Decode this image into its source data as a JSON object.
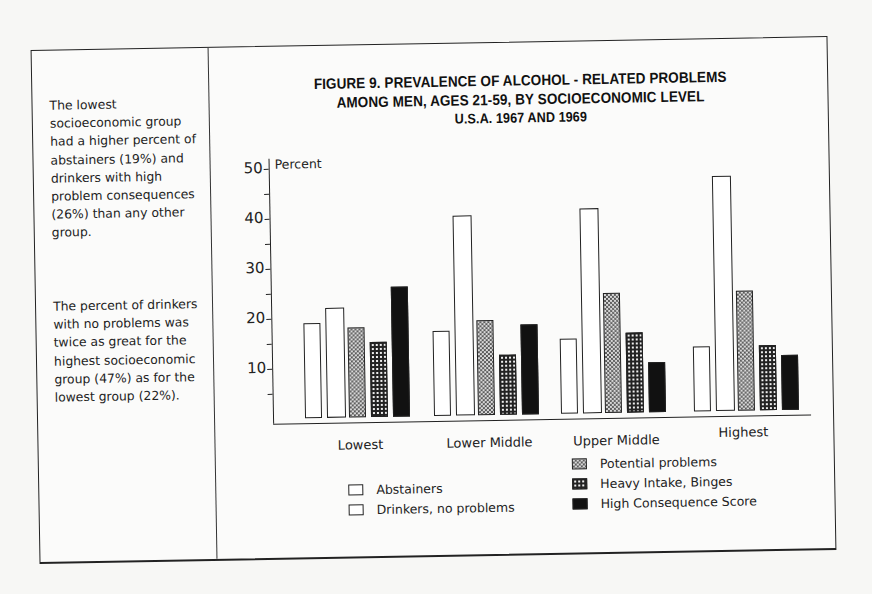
{
  "sidebar_notes": {
    "note1": "The lowest socioeconomic group had a higher percent of abstainers (19%) and drinkers with high problem consequences (26%) than any other group.",
    "note2": "The percent of drinkers with no problems was twice as great for the highest socioeconomic group (47%) as for the lowest group (22%)."
  },
  "chart_data": {
    "type": "bar",
    "title": "FIGURE 9. PREVALENCE OF ALCOHOL - RELATED PROBLEMS AMONG MEN, AGES 21-59, BY SOCIOECONOMIC LEVEL U.S.A. 1967 AND 1969",
    "title_lines": [
      "FIGURE 9.  PREVALENCE OF ALCOHOL - RELATED PROBLEMS",
      "AMONG MEN, AGES 21-59, BY SOCIOECONOMIC LEVEL",
      "U.S.A. 1967 AND 1969"
    ],
    "xlabel": "",
    "ylabel": "Percent",
    "ylim": [
      0,
      50
    ],
    "yticks": [
      10,
      20,
      30,
      40,
      50
    ],
    "grid": false,
    "legend_position": "bottom",
    "categories": [
      "Lowest",
      "Lower Middle",
      "Upper Middle",
      "Highest"
    ],
    "series": [
      {
        "name": "Abstainers",
        "pattern": "white",
        "values": [
          19,
          17,
          15,
          13
        ]
      },
      {
        "name": "Drinkers, no problems",
        "pattern": "white",
        "values": [
          22,
          40,
          41,
          47
        ]
      },
      {
        "name": "Potential problems",
        "pattern": "light-checker",
        "values": [
          18,
          19,
          24,
          24
        ]
      },
      {
        "name": "Heavy Intake, Binges",
        "pattern": "dark-checker",
        "values": [
          15,
          12,
          16,
          13
        ]
      },
      {
        "name": "High Consequence Score",
        "pattern": "solid-black",
        "values": [
          26,
          18,
          10,
          11
        ]
      }
    ]
  },
  "axis": {
    "ylabel": "Percent",
    "ticks": [
      "10",
      "20",
      "30",
      "40",
      "50"
    ]
  },
  "legend": {
    "abstainers": "Abstainers",
    "no_problems": "Drinkers, no problems",
    "potential": "Potential problems",
    "heavy": "Heavy Intake, Binges",
    "high": "High Consequence Score"
  }
}
